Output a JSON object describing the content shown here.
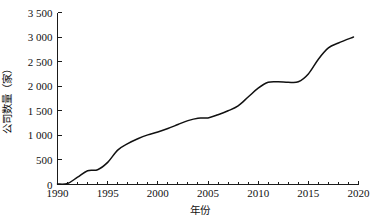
{
  "chart_data": {
    "type": "line",
    "title": "",
    "xlabel": "年份",
    "ylabel": "公司数量（家）",
    "xlim": [
      1990,
      2020
    ],
    "ylim": [
      0,
      3500
    ],
    "grid": false,
    "legend": null,
    "x_ticks": [
      "1990",
      "1995",
      "2000",
      "2005",
      "2010",
      "2015",
      "2020"
    ],
    "x_tick_values": [
      1990,
      1995,
      2000,
      2005,
      2010,
      2015,
      2020
    ],
    "y_ticks": [
      "0",
      "500",
      "1 000",
      "1 500",
      "2 000",
      "2 500",
      "3 000",
      "3 500"
    ],
    "y_tick_values": [
      0,
      500,
      1000,
      1500,
      2000,
      2500,
      3000,
      3500
    ],
    "series": [
      {
        "name": "公司数量",
        "color": "#111111",
        "x": [
          1990,
          1991,
          1992,
          1993,
          1994,
          1995,
          1996,
          1997,
          1998,
          1999,
          2000,
          2001,
          2002,
          2003,
          2004,
          2005,
          2006,
          2007,
          2008,
          2009,
          2010,
          2011,
          2012,
          2013,
          2014,
          2015,
          2016,
          2017,
          2018,
          2019.5
        ],
        "values": [
          10,
          20,
          150,
          280,
          300,
          450,
          700,
          830,
          930,
          1010,
          1070,
          1140,
          1220,
          1300,
          1350,
          1355,
          1420,
          1500,
          1600,
          1780,
          1960,
          2080,
          2090,
          2080,
          2090,
          2250,
          2550,
          2780,
          2880,
          3000
        ]
      }
    ]
  },
  "axis": {
    "x_title": "年份",
    "y_title": "公司数量（家）"
  }
}
